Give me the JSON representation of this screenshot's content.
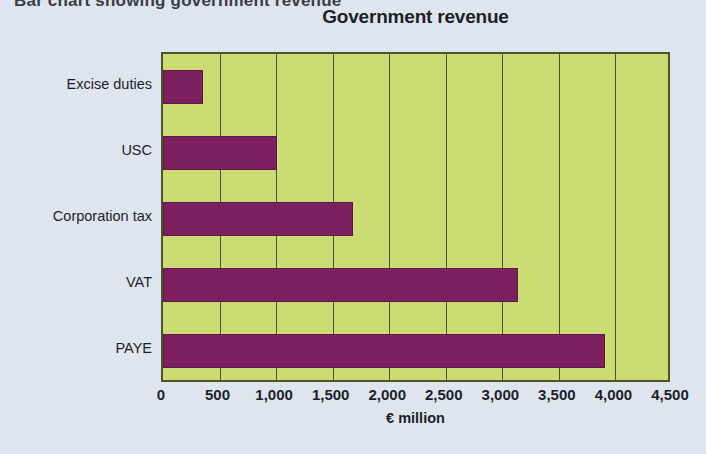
{
  "page": {
    "background_color": "#dfe5ef",
    "top_cutoff_text": "Bar chart showing government revenue"
  },
  "chart_data": {
    "type": "bar",
    "orientation": "horizontal",
    "title": "Government revenue",
    "xlabel": "€ million",
    "ylabel": "",
    "categories": [
      "Excise duties",
      "USC",
      "Corporation tax",
      "VAT",
      "PAYE"
    ],
    "values": [
      350,
      1010,
      1680,
      3140,
      3910
    ],
    "xlim": [
      0,
      4500
    ],
    "xticks": [
      0,
      500,
      1000,
      1500,
      2000,
      2500,
      3000,
      3500,
      4000,
      4500
    ],
    "xtick_labels": [
      "0",
      "500",
      "1,000",
      "1,500",
      "2,000",
      "2,500",
      "3,000",
      "3,500",
      "4,000",
      "4,500"
    ],
    "grid": true,
    "grid_axis": "x",
    "legend": false,
    "bar_color": "#7d2060",
    "plot_background_color": "#cbdd72",
    "gridline_color": "#4d5526",
    "axis_border_color": "#4d5526"
  }
}
